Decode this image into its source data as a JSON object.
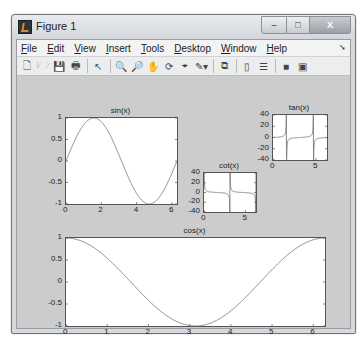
{
  "window": {
    "title": "Figure 1",
    "controls": {
      "minimize": "–",
      "maximize": "□",
      "close": "X"
    }
  },
  "menubar": {
    "items": [
      {
        "label": "File",
        "mnemonic": "F"
      },
      {
        "label": "Edit",
        "mnemonic": "E"
      },
      {
        "label": "View",
        "mnemonic": "V"
      },
      {
        "label": "Insert",
        "mnemonic": "I"
      },
      {
        "label": "Tools",
        "mnemonic": "T"
      },
      {
        "label": "Desktop",
        "mnemonic": "D"
      },
      {
        "label": "Window",
        "mnemonic": "W"
      },
      {
        "label": "Help",
        "mnemonic": "H"
      }
    ]
  },
  "toolbar": {
    "buttons": [
      {
        "name": "new-figure",
        "glyph": "🗋"
      },
      {
        "name": "open-file",
        "glyph": "🗁"
      },
      {
        "name": "save-figure",
        "glyph": "💾"
      },
      {
        "name": "print-figure",
        "glyph": "🖶"
      },
      {
        "sep": true
      },
      {
        "name": "edit-plot",
        "glyph": "↖"
      },
      {
        "sep": true
      },
      {
        "name": "zoom-in",
        "glyph": "🔍"
      },
      {
        "name": "zoom-out",
        "glyph": "🔎"
      },
      {
        "name": "pan",
        "glyph": "✋"
      },
      {
        "name": "rotate-3d",
        "glyph": "⟳"
      },
      {
        "name": "data-cursor",
        "glyph": "⌖"
      },
      {
        "name": "brush",
        "glyph": "✎▾"
      },
      {
        "sep": true
      },
      {
        "name": "link-plot",
        "glyph": "⧉"
      },
      {
        "sep": true
      },
      {
        "name": "insert-colorbar",
        "glyph": "▯"
      },
      {
        "name": "insert-legend",
        "glyph": "☰"
      },
      {
        "sep": true
      },
      {
        "name": "hide-plot-tools",
        "glyph": "■"
      },
      {
        "name": "show-plot-tools",
        "glyph": "▣"
      }
    ]
  },
  "chart_data": [
    {
      "type": "line",
      "title": "sin(x)",
      "function": "sin",
      "x_range": [
        0,
        6.2832
      ],
      "xlim": [
        0,
        6.2832
      ],
      "ylim": [
        -1,
        1
      ],
      "xticks": [
        0,
        2,
        4,
        6
      ],
      "yticks": [
        -1,
        -0.5,
        0,
        0.5,
        1
      ],
      "ytick_labels": [
        "-1",
        "-0.5",
        "0",
        "0.5",
        "1"
      ],
      "xtick_labels": [
        "0",
        "2",
        "4",
        "6"
      ],
      "box": {
        "left": 48,
        "top": 41,
        "width": 111,
        "height": 86
      }
    },
    {
      "type": "line",
      "title": "tan(x)",
      "function": "tan",
      "x_range": [
        0,
        6.2832
      ],
      "xlim": [
        0,
        6.2832
      ],
      "ylim": [
        -40,
        40
      ],
      "xticks": [
        0,
        5
      ],
      "yticks": [
        -40,
        -20,
        0,
        20,
        40
      ],
      "ytick_labels": [
        "-40",
        "-20",
        "0",
        "20",
        "40"
      ],
      "xtick_labels": [
        "0",
        "5"
      ],
      "box": {
        "left": 255,
        "top": 38,
        "width": 54,
        "height": 45
      }
    },
    {
      "type": "line",
      "title": "cot(x)",
      "function": "cot",
      "x_range": [
        0,
        6.2832
      ],
      "xlim": [
        0,
        6.2832
      ],
      "ylim": [
        -40,
        40
      ],
      "xticks": [
        0,
        5
      ],
      "yticks": [
        -40,
        -20,
        0,
        20,
        40
      ],
      "ytick_labels": [
        "-40",
        "-20",
        "0",
        "20",
        "40"
      ],
      "xtick_labels": [
        "0",
        "5"
      ],
      "box": {
        "left": 186,
        "top": 96,
        "width": 52,
        "height": 39
      }
    },
    {
      "type": "line",
      "title": "cos(x)",
      "function": "cos",
      "x_range": [
        0,
        6.2832
      ],
      "xlim": [
        0,
        6.2832
      ],
      "ylim": [
        -1,
        1
      ],
      "xticks": [
        0,
        1,
        2,
        3,
        4,
        5,
        6
      ],
      "yticks": [
        -1,
        -0.5,
        0,
        0.5,
        1
      ],
      "ytick_labels": [
        "-1",
        "-0.5",
        "0",
        "0.5",
        "1"
      ],
      "xtick_labels": [
        "0",
        "1",
        "2",
        "3",
        "4",
        "5",
        "6"
      ],
      "box": {
        "left": 48,
        "top": 161,
        "width": 259,
        "height": 88
      }
    }
  ],
  "colors": {
    "line": "#7a7a7a",
    "axes_bg": "#ffffff",
    "figure_bg": "#cccccc"
  }
}
